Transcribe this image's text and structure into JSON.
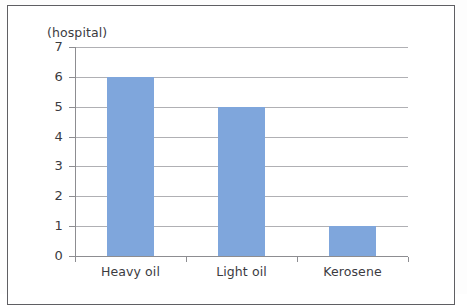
{
  "chart_data": {
    "type": "bar",
    "title": "",
    "subtitle": "",
    "xlabel": "",
    "ylabel": "(hospital)",
    "categories": [
      "Heavy oil",
      "Light oil",
      "Kerosene"
    ],
    "values": [
      6,
      5,
      1
    ],
    "series": [
      {
        "name": "hospital",
        "values": [
          6,
          5,
          1
        ]
      }
    ],
    "ylim": [
      0,
      7
    ],
    "y_ticks": [
      "0",
      "1",
      "2",
      "3",
      "4",
      "5",
      "6",
      "7"
    ],
    "grid": true,
    "legend": "none",
    "bar_color": "#7fa6dc",
    "gridline_color": "#b0b0b4",
    "axis_color": "#8d8d91",
    "text_color": "#3b3b3f"
  }
}
